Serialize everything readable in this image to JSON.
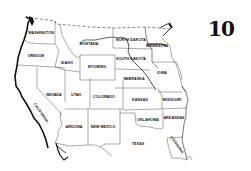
{
  "page": {
    "number": "10"
  },
  "map": {
    "title": "Western United States",
    "states": [
      {
        "id": "washington",
        "label": "WASHINGTON",
        "x": 41,
        "y": 33,
        "rotate": 0
      },
      {
        "id": "oregon",
        "label": "OREGON",
        "x": 36,
        "y": 56,
        "rotate": 0
      },
      {
        "id": "idaho",
        "label": "IDAHO",
        "x": 67,
        "y": 63,
        "rotate": 0
      },
      {
        "id": "montana",
        "label": "MONTANA",
        "x": 89,
        "y": 44,
        "rotate": 0
      },
      {
        "id": "wyoming",
        "label": "WYOMING",
        "x": 97,
        "y": 67,
        "rotate": 0
      },
      {
        "id": "north-dakota",
        "label": "NORTH DAKOTA",
        "x": 131,
        "y": 40,
        "rotate": 0
      },
      {
        "id": "south-dakota",
        "label": "SOUTH DAKOTA",
        "x": 131,
        "y": 59,
        "rotate": 0
      },
      {
        "id": "minnesota",
        "label": "MINNESOTA",
        "x": 157,
        "y": 46,
        "rotate": 0
      },
      {
        "id": "nebraska",
        "label": "NEBRASKA",
        "x": 134,
        "y": 79,
        "rotate": 0
      },
      {
        "id": "iowa",
        "label": "IOWA",
        "x": 162,
        "y": 73,
        "rotate": 0
      },
      {
        "id": "nevada",
        "label": "NEVADA",
        "x": 54,
        "y": 95,
        "rotate": 0
      },
      {
        "id": "utah",
        "label": "UTAH",
        "x": 76,
        "y": 95,
        "rotate": 0
      },
      {
        "id": "colorado",
        "label": "COLORADO",
        "x": 104,
        "y": 97,
        "rotate": 0
      },
      {
        "id": "kansas",
        "label": "KANSAS",
        "x": 140,
        "y": 100,
        "rotate": 0
      },
      {
        "id": "missouri",
        "label": "MISSOURI",
        "x": 172,
        "y": 100,
        "rotate": 0
      },
      {
        "id": "california",
        "label": "CALIFORNIA",
        "x": 41,
        "y": 113,
        "rotate": 55
      },
      {
        "id": "arizona",
        "label": "ARIZONA",
        "x": 74,
        "y": 127,
        "rotate": 0
      },
      {
        "id": "new-mexico",
        "label": "NEW MEXICO",
        "x": 103,
        "y": 127,
        "rotate": 0
      },
      {
        "id": "oklahoma",
        "label": "OKLAHOMA",
        "x": 148,
        "y": 120,
        "rotate": 0
      },
      {
        "id": "arkansas",
        "label": "ARKANSAS",
        "x": 174,
        "y": 118,
        "rotate": 0
      },
      {
        "id": "texas",
        "label": "TEXAS",
        "x": 138,
        "y": 144,
        "rotate": 0
      },
      {
        "id": "louisiana",
        "label": "LOUISIANA",
        "x": 177,
        "y": 145,
        "rotate": 55
      }
    ]
  }
}
